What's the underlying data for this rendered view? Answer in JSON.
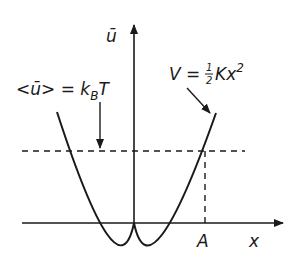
{
  "diagram": {
    "y_axis_label": "ū",
    "x_axis_label": "x",
    "amplitude_label": "A",
    "mean_energy_label": {
      "lhs": "<ū> = k",
      "subscript": "B",
      "rhs": "T"
    },
    "potential_label": {
      "lhs": "V = ",
      "fraction_num": "1",
      "fraction_den": "2",
      "rhs": "Kx",
      "exponent": "2"
    },
    "colors": {
      "stroke": "#1a1a1a",
      "background": "#ffffff"
    }
  }
}
